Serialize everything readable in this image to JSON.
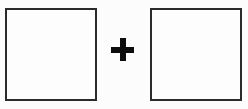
{
  "canvas": {
    "width": 248,
    "height": 109,
    "background_color": "#fcfcfc"
  },
  "diagram": {
    "operator_label": "+",
    "left_box": {
      "label": "",
      "fill_color": "#fdfdfd",
      "border_color": "#2b2b2b",
      "border_width": 2,
      "x": 5,
      "y": 8,
      "width": 92,
      "height": 93
    },
    "operator": {
      "name": "plus-sign",
      "symbol": "+",
      "color": "#0d0d0d",
      "x": 111,
      "y": 38,
      "size": 23,
      "stroke": 6
    },
    "right_box": {
      "label": "",
      "fill_color": "#fdfdfd",
      "border_color": "#2b2b2b",
      "border_width": 2,
      "x": 150,
      "y": 8,
      "width": 92,
      "height": 93
    }
  }
}
